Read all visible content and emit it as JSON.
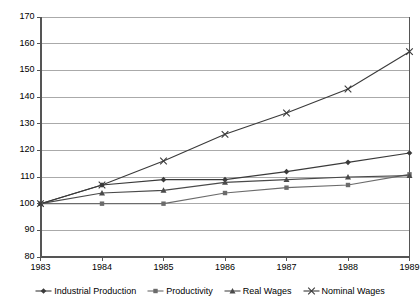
{
  "chart_data": {
    "type": "line",
    "title": "",
    "subtitle": "",
    "xlabel": "",
    "ylabel": "",
    "categories": [
      "1983",
      "1984",
      "1985",
      "1986",
      "1987",
      "1988",
      "1989"
    ],
    "x": [
      1983,
      1984,
      1985,
      1986,
      1987,
      1988,
      1989
    ],
    "ylim": [
      80,
      170
    ],
    "ytick_step": 10,
    "yticks": [
      80,
      90,
      100,
      110,
      120,
      130,
      140,
      150,
      160,
      170
    ],
    "ytick_labels": [
      "80",
      "90",
      "100",
      "110",
      "120",
      "130",
      "140",
      "150",
      "160",
      "170"
    ],
    "xtick_labels": [
      "1983",
      "1984",
      "1985",
      "1986",
      "1987",
      "1988",
      "1989"
    ],
    "grid": "horizontal",
    "legend_position": "bottom",
    "series": [
      {
        "name": "Industrial Production",
        "marker": "diamond",
        "color": "#3a3a3a",
        "values": [
          100,
          107,
          109,
          109,
          112,
          115.5,
          119
        ]
      },
      {
        "name": "Productivity",
        "marker": "square",
        "color": "#6b6b6b",
        "values": [
          100,
          100,
          100,
          104,
          106,
          107,
          111
        ]
      },
      {
        "name": "Real Wages",
        "marker": "triangle",
        "color": "#4a4a4a",
        "values": [
          100,
          104,
          105,
          108,
          109,
          110,
          110.5
        ]
      },
      {
        "name": "Nominal Wages",
        "marker": "cross",
        "color": "#3a3a3a",
        "values": [
          100,
          107,
          116,
          126,
          134,
          143,
          157
        ]
      }
    ]
  },
  "legend": {
    "items": [
      {
        "label": "Industrial Production"
      },
      {
        "label": "Productivity"
      },
      {
        "label": "Real Wages"
      },
      {
        "label": "Nominal Wages"
      }
    ]
  },
  "colors": {
    "axis": "#555555",
    "grid": "#aaaaaa",
    "text": "#000000",
    "background": "#ffffff"
  }
}
